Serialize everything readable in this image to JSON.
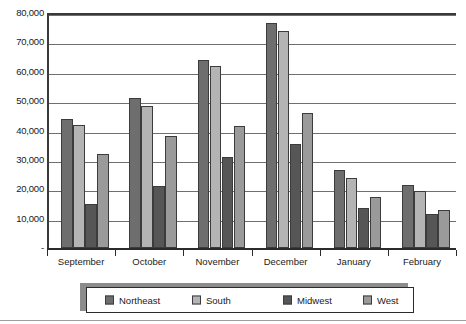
{
  "chart_data": {
    "type": "bar",
    "title": "",
    "subtitle": "",
    "xlabel": "",
    "ylabel": "",
    "categories": [
      "September",
      "October",
      "November",
      "December",
      "January",
      "February"
    ],
    "series": [
      {
        "name": "Northeast",
        "color": "#6e6e6e",
        "values": [
          44000,
          51000,
          64000,
          76500,
          26500,
          21500
        ]
      },
      {
        "name": "South",
        "color": "#b4b4b4",
        "values": [
          42000,
          48500,
          62000,
          74000,
          24000,
          19500
        ]
      },
      {
        "name": "Midwest",
        "color": "#565656",
        "values": [
          15000,
          21000,
          31000,
          35500,
          13500,
          11500
        ]
      },
      {
        "name": "West",
        "color": "#9a9a9a",
        "values": [
          32000,
          38000,
          41500,
          46000,
          17500,
          13000
        ]
      }
    ],
    "extra_series_note": "",
    "ylim": [
      0,
      80000
    ],
    "yticks": [
      0,
      10000,
      20000,
      30000,
      40000,
      50000,
      60000,
      70000,
      80000
    ],
    "ytick_labels": [
      "-",
      "10,000",
      "20,000",
      "30,000",
      "40,000",
      "50,000",
      "60,000",
      "70,000",
      "80,000"
    ],
    "grid": true,
    "legend_position": "bottom"
  },
  "legend": {
    "items": [
      {
        "label": "Northeast"
      },
      {
        "label": "South"
      },
      {
        "label": "Midwest"
      },
      {
        "label": "West"
      }
    ]
  }
}
